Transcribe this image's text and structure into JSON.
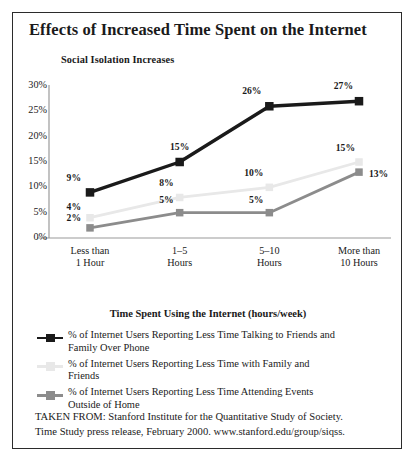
{
  "title": "Effects of Increased Time Spent on the Internet",
  "subtitle": "Social Isolation Increases",
  "legend_title": "Time Spent Using the Internet (hours/week)",
  "source_line1": "TAKEN FROM: Stanford Institute for the Quantitative Study of Society.",
  "source_line2": "Time Study press release, February 2000. www.stanford.edu/group/siqss.",
  "colors": {
    "series_dark": "#1a1a1a",
    "series_light": "#e8e8e8",
    "series_mid": "#8c8c8c",
    "axis": "#9a9a9a",
    "border": "#2b2b2b",
    "text": "#1a1a1a"
  },
  "chart_data": {
    "type": "line",
    "title": "Social Isolation Increases",
    "xlabel": "Time Spent Using the Internet (hours/week)",
    "ylabel": "",
    "ylim": [
      0,
      30
    ],
    "yticks": [
      "0%",
      "5%",
      "10%",
      "15%",
      "20%",
      "25%",
      "30%"
    ],
    "ytick_values": [
      0,
      5,
      10,
      15,
      20,
      25,
      30
    ],
    "grid": false,
    "legend_position": "bottom",
    "categories": [
      "Less than 1 Hour",
      "1–5 Hours",
      "5–10 Hours",
      "More than 10 Hours"
    ],
    "category_lines": [
      [
        "Less than",
        "1 Hour"
      ],
      [
        "1–5",
        "Hours"
      ],
      [
        "5–10",
        "Hours"
      ],
      [
        "More than",
        "10 Hours"
      ]
    ],
    "series": [
      {
        "name": "% of Internet Users Reporting Less Time Talking to Friends and Family Over Phone",
        "legend_lines": [
          "% of Internet Users Reporting Less Time Talking to Friends and",
          "Family Over Phone"
        ],
        "color": "#1a1a1a",
        "values": [
          9,
          15,
          26,
          27
        ],
        "labels": [
          "9%",
          "15%",
          "26%",
          "27%"
        ]
      },
      {
        "name": "% of Internet Users Reporting Less Time with Family and Friends",
        "legend_lines": [
          "% of Internet Users Reporting Less Time with Family and",
          "Friends"
        ],
        "color": "#e8e8e8",
        "values": [
          4,
          8,
          10,
          15
        ],
        "labels": [
          "4%",
          "8%",
          "10%",
          "15%"
        ]
      },
      {
        "name": "% of Internet Users Reporting Less Time Attending Events Outside of Home",
        "legend_lines": [
          "% of Internet Users Reporting Less Time Attending Events",
          "Outside of Home"
        ],
        "color": "#8c8c8c",
        "values": [
          2,
          5,
          5,
          13
        ],
        "labels": [
          "2%",
          "5%",
          "5%",
          "13%"
        ]
      }
    ]
  }
}
